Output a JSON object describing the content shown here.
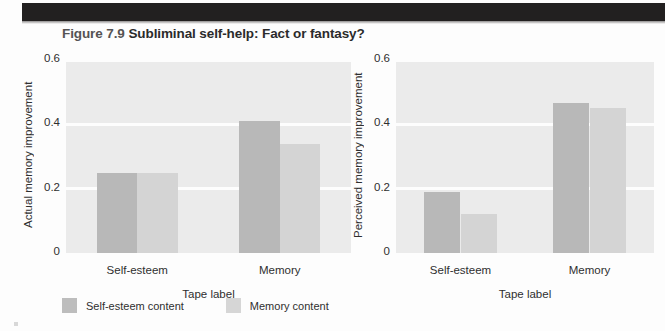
{
  "figure": {
    "number": "Figure 7.9",
    "title": "Subliminal self-help: Fact or fantasy?"
  },
  "legend": {
    "items": [
      {
        "label": "Self-esteem content",
        "color": "#bdbdbd"
      },
      {
        "label": "Memory content",
        "color": "#d6d6d6"
      }
    ]
  },
  "chart_data": [
    {
      "type": "bar",
      "panel": "left",
      "title": "",
      "xlabel": "Tape label",
      "ylabel": "Actual memory improvement",
      "categories": [
        "Self-esteem",
        "Memory"
      ],
      "yticks": [
        "0",
        "0.2",
        "0.4",
        "0.6"
      ],
      "ytick_values": [
        0,
        0.2,
        0.4,
        0.6
      ],
      "ylim": [
        0,
        0.6
      ],
      "grid": true,
      "legend_position": "below-figure",
      "series": [
        {
          "name": "Self-esteem content",
          "values": [
            0.25,
            0.41
          ]
        },
        {
          "name": "Memory content",
          "values": [
            0.25,
            0.34
          ]
        }
      ]
    },
    {
      "type": "bar",
      "panel": "right",
      "title": "",
      "xlabel": "Tape label",
      "ylabel": "Perceived memory improvement",
      "categories": [
        "Self-esteem",
        "Memory"
      ],
      "yticks": [
        "0",
        "0.2",
        "0.4",
        "0.6"
      ],
      "ytick_values": [
        0,
        0.2,
        0.4,
        0.6
      ],
      "ylim": [
        0,
        0.6
      ],
      "grid": true,
      "legend_position": "below-figure",
      "series": [
        {
          "name": "Self-esteem content",
          "values": [
            0.19,
            0.465
          ]
        },
        {
          "name": "Memory content",
          "values": [
            0.12,
            0.45
          ]
        }
      ]
    }
  ]
}
